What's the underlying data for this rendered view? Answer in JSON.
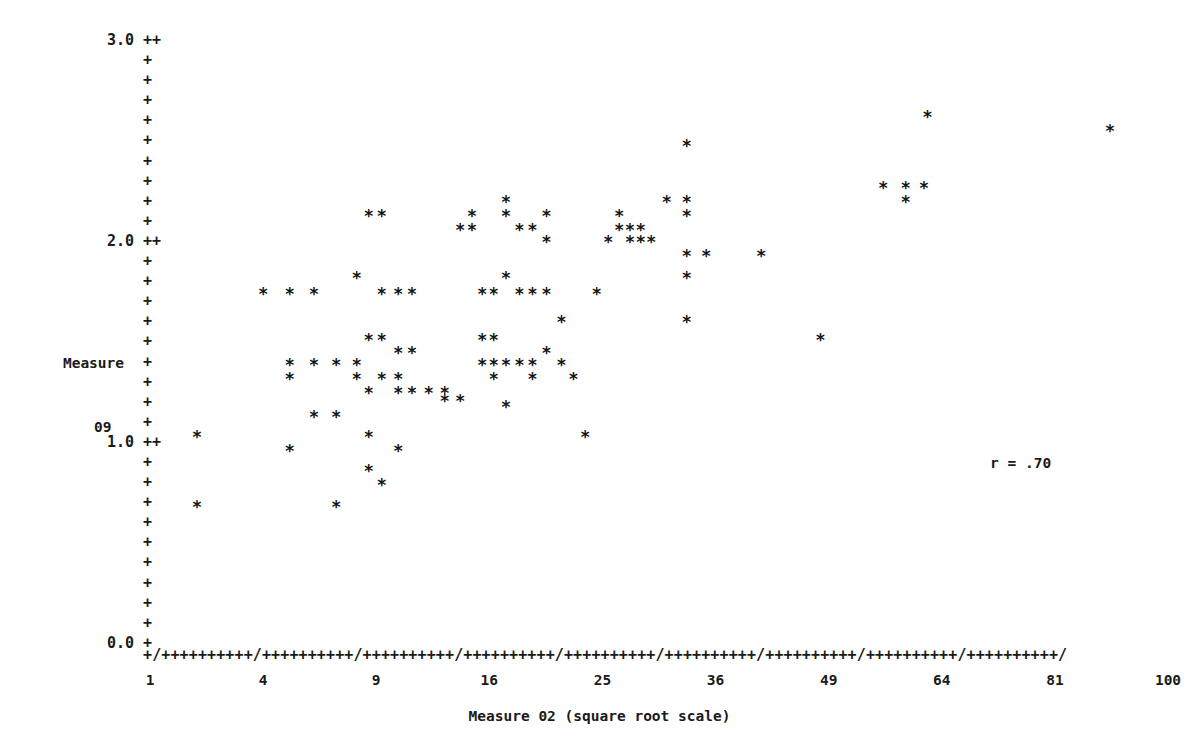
{
  "chart_data": {
    "type": "scatter",
    "title": "",
    "xlabel": "Measure 02 (square root scale)",
    "ylabel": "Measure 09",
    "ylabel_lines": [
      "Measure",
      "09"
    ],
    "annotation": "r = .70",
    "correlation": 0.7,
    "marker": "*",
    "grid": false,
    "legend": null,
    "x_scale": "square root",
    "xlim": [
      1,
      100
    ],
    "ylim": [
      0.0,
      3.0
    ],
    "x_ticks": [
      1,
      4,
      9,
      16,
      25,
      36,
      49,
      64,
      81,
      100
    ],
    "x_tick_labels": [
      "1",
      "4",
      "9",
      "16",
      "25",
      "36",
      "49",
      "64",
      "81",
      "100"
    ],
    "y_ticks": [
      0.0,
      1.0,
      2.0,
      3.0
    ],
    "y_tick_labels": [
      "0.0",
      "1.0",
      "2.0",
      "3.0"
    ],
    "y_minor_per_major": 10,
    "axis_glyph_vertical": "+",
    "axis_glyph_major_vertical": "++",
    "axis_row_major": "+/++++++++++/++++++++++/++++++++++/++++++++++/++++++++++/++++++++++/++++++++++/++++++++++/++++++++++/",
    "n_points": 97,
    "points": [
      [
        2.0,
        1.07
      ],
      [
        2.0,
        0.72
      ],
      [
        4.0,
        1.78
      ],
      [
        5.0,
        1.78
      ],
      [
        5.0,
        1.43
      ],
      [
        5.0,
        1.36
      ],
      [
        5.0,
        1.0
      ],
      [
        6.0,
        1.78
      ],
      [
        6.0,
        1.43
      ],
      [
        6.0,
        1.17
      ],
      [
        7.0,
        1.43
      ],
      [
        7.0,
        1.17
      ],
      [
        7.0,
        0.72
      ],
      [
        8.0,
        1.86
      ],
      [
        8.0,
        1.43
      ],
      [
        8.0,
        1.36
      ],
      [
        8.6,
        2.17
      ],
      [
        8.6,
        1.55
      ],
      [
        8.6,
        1.29
      ],
      [
        8.6,
        1.07
      ],
      [
        8.6,
        0.9
      ],
      [
        9.3,
        2.17
      ],
      [
        9.3,
        1.78
      ],
      [
        9.3,
        1.55
      ],
      [
        9.3,
        1.36
      ],
      [
        9.3,
        0.83
      ],
      [
        10.2,
        1.78
      ],
      [
        10.2,
        1.49
      ],
      [
        10.2,
        1.36
      ],
      [
        10.2,
        1.29
      ],
      [
        10.2,
        1.0
      ],
      [
        11.0,
        1.78
      ],
      [
        11.0,
        1.49
      ],
      [
        11.0,
        1.29
      ],
      [
        12.0,
        1.29
      ],
      [
        13.0,
        1.29
      ],
      [
        13.0,
        1.25
      ],
      [
        14.0,
        2.1
      ],
      [
        14.0,
        1.25
      ],
      [
        14.8,
        2.17
      ],
      [
        14.8,
        2.1
      ],
      [
        15.5,
        1.78
      ],
      [
        15.5,
        1.55
      ],
      [
        15.5,
        1.43
      ],
      [
        16.3,
        1.78
      ],
      [
        16.3,
        1.55
      ],
      [
        16.3,
        1.43
      ],
      [
        16.3,
        1.36
      ],
      [
        17.2,
        2.24
      ],
      [
        17.2,
        2.17
      ],
      [
        17.2,
        1.86
      ],
      [
        17.2,
        1.43
      ],
      [
        17.2,
        1.22
      ],
      [
        18.2,
        2.1
      ],
      [
        18.2,
        1.78
      ],
      [
        18.2,
        1.43
      ],
      [
        19.2,
        2.1
      ],
      [
        19.2,
        1.78
      ],
      [
        19.2,
        1.43
      ],
      [
        19.2,
        1.36
      ],
      [
        20.3,
        2.17
      ],
      [
        20.3,
        2.04
      ],
      [
        20.3,
        1.78
      ],
      [
        20.3,
        1.49
      ],
      [
        21.5,
        1.64
      ],
      [
        21.5,
        1.43
      ],
      [
        22.5,
        1.36
      ],
      [
        23.5,
        1.07
      ],
      [
        24.5,
        1.78
      ],
      [
        25.5,
        2.04
      ],
      [
        26.5,
        2.17
      ],
      [
        26.5,
        2.1
      ],
      [
        27.5,
        2.1
      ],
      [
        27.5,
        2.04
      ],
      [
        28.5,
        2.1
      ],
      [
        28.5,
        2.04
      ],
      [
        29.5,
        2.04
      ],
      [
        31.0,
        2.24
      ],
      [
        33.0,
        2.52
      ],
      [
        33.0,
        2.24
      ],
      [
        33.0,
        2.17
      ],
      [
        33.0,
        1.86
      ],
      [
        33.0,
        1.64
      ],
      [
        33.0,
        1.97
      ],
      [
        35.0,
        1.97
      ],
      [
        41.0,
        1.97
      ],
      [
        48.0,
        1.55
      ],
      [
        56.0,
        2.31
      ],
      [
        59.0,
        2.31
      ],
      [
        59.0,
        2.24
      ],
      [
        61.5,
        2.31
      ],
      [
        62.0,
        2.66
      ],
      [
        90.0,
        2.59
      ]
    ]
  },
  "axis": {
    "y_rows": [
      {
        "label": "3.0",
        "mark": "++"
      },
      {
        "label": "",
        "mark": "+"
      },
      {
        "label": "",
        "mark": "+"
      },
      {
        "label": "",
        "mark": "+"
      },
      {
        "label": "",
        "mark": "+"
      },
      {
        "label": "",
        "mark": "+"
      },
      {
        "label": "",
        "mark": "+"
      },
      {
        "label": "",
        "mark": "+"
      },
      {
        "label": "",
        "mark": "+"
      },
      {
        "label": "",
        "mark": "+"
      },
      {
        "label": "2.0",
        "mark": "++"
      },
      {
        "label": "",
        "mark": "+"
      },
      {
        "label": "",
        "mark": "+"
      },
      {
        "label": "",
        "mark": "+"
      },
      {
        "label": "",
        "mark": "+"
      },
      {
        "label": "",
        "mark": "+"
      },
      {
        "label": "",
        "mark": "+"
      },
      {
        "label": "",
        "mark": "+"
      },
      {
        "label": "",
        "mark": "+"
      },
      {
        "label": "",
        "mark": "+"
      },
      {
        "label": "1.0",
        "mark": "++"
      },
      {
        "label": "",
        "mark": "+"
      },
      {
        "label": "",
        "mark": "+"
      },
      {
        "label": "",
        "mark": "+"
      },
      {
        "label": "",
        "mark": "+"
      },
      {
        "label": "",
        "mark": "+"
      },
      {
        "label": "",
        "mark": "+"
      },
      {
        "label": "",
        "mark": "+"
      },
      {
        "label": "",
        "mark": "+"
      },
      {
        "label": "",
        "mark": "+"
      },
      {
        "label": "0.0",
        "mark": "+"
      }
    ]
  }
}
